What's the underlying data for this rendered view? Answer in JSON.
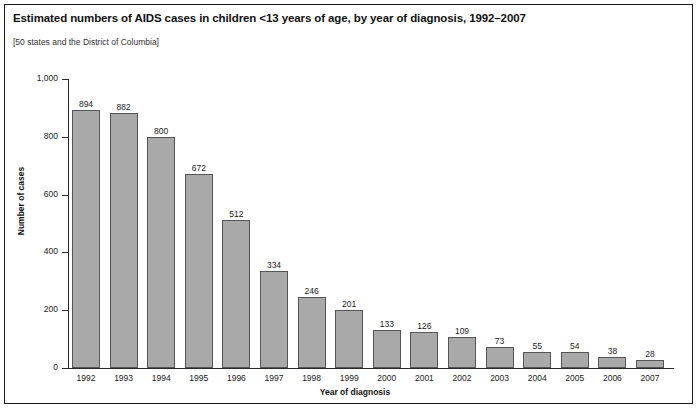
{
  "figure": {
    "title": "Estimated numbers of AIDS cases in children <13 years of age, by year of diagnosis, 1992–2007",
    "subtitle": "[50 states and the District of Columbia]",
    "frame_color": "#1a1a1a",
    "bar_fill": "#a9a9a9",
    "bar_stroke": "#555555",
    "background": "#ffffff"
  },
  "chart_data": {
    "type": "bar",
    "title": "Estimated numbers of AIDS cases in children <13 years of age, by year of diagnosis, 1992–2007",
    "subtitle": "[50 states and the District of Columbia]",
    "xlabel": "Year of diagnosis",
    "ylabel": "Number of cases",
    "categories": [
      "1992",
      "1993",
      "1994",
      "1995",
      "1996",
      "1997",
      "1998",
      "1999",
      "2000",
      "2001",
      "2002",
      "2003",
      "2004",
      "2005",
      "2006",
      "2007"
    ],
    "values": [
      894,
      882,
      800,
      672,
      512,
      334,
      246,
      201,
      133,
      126,
      109,
      73,
      55,
      54,
      38,
      28
    ],
    "value_labels": [
      "894",
      "882",
      "800",
      "672",
      "512",
      "334",
      "246",
      "201",
      "133",
      "126",
      "109",
      "73",
      "55",
      "54",
      "38",
      "28"
    ],
    "ylim": [
      0,
      1000
    ],
    "yticks": [
      0,
      200,
      400,
      600,
      800,
      1000
    ],
    "ytick_labels": [
      "0",
      "200",
      "400",
      "600",
      "800",
      "1,000"
    ],
    "grid": false,
    "legend": null,
    "series": [
      {
        "name": "Estimated AIDS cases in children <13 years",
        "values": [
          894,
          882,
          800,
          672,
          512,
          334,
          246,
          201,
          133,
          126,
          109,
          73,
          55,
          54,
          38,
          28
        ]
      }
    ]
  }
}
